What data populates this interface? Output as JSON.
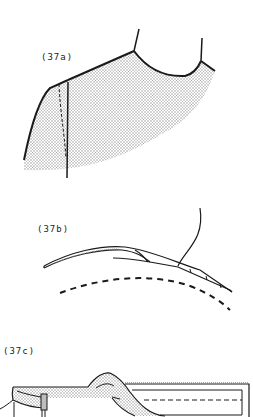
{
  "figures": [
    {
      "id": "37a",
      "label": "(37a)"
    },
    {
      "id": "37b",
      "label": "(37b)"
    },
    {
      "id": "37c",
      "label": "(37c)"
    }
  ],
  "colors": {
    "ink": "#1a1a1a",
    "shade": "#bdbdbd",
    "paper": "#ffffff"
  }
}
